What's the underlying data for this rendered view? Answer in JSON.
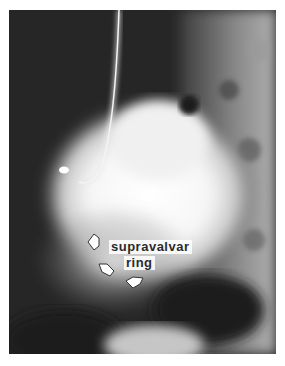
{
  "figure": {
    "annotation": {
      "line1": "supravalvar",
      "line2": "ring"
    },
    "arrows": [
      {
        "position": "left",
        "direction": "pointing-left"
      },
      {
        "position": "lower-left",
        "direction": "pointing-up-left"
      },
      {
        "position": "bottom",
        "direction": "pointing-left"
      }
    ]
  }
}
